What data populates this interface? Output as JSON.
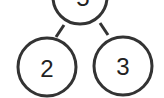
{
  "diagram": {
    "type": "tree",
    "nodes": [
      {
        "id": "root",
        "label": "5",
        "cx": 80,
        "cy": -3,
        "r": 27
      },
      {
        "id": "left",
        "label": "2",
        "cx": 47,
        "cy": 67,
        "r": 29
      },
      {
        "id": "right",
        "label": "3",
        "cx": 123,
        "cy": 66,
        "r": 29
      }
    ],
    "edges": [
      {
        "from": "root",
        "to": "left"
      },
      {
        "from": "root",
        "to": "right"
      }
    ],
    "colors": {
      "stroke": "#333333",
      "text": "#222222",
      "background": "#ffffff"
    }
  }
}
